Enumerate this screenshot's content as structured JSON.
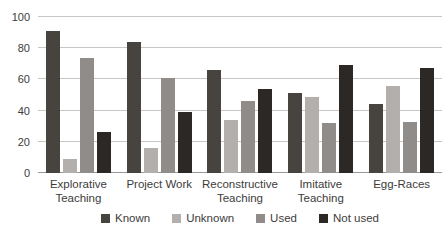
{
  "chart_data": {
    "type": "bar",
    "title": "",
    "xlabel": "",
    "ylabel": "",
    "categories": [
      "Explorative Teaching",
      "Project Work",
      "Reconstructive Teaching",
      "Imitative Teaching",
      "Egg-Races"
    ],
    "series": [
      {
        "name": "Known",
        "color": "#474440",
        "values": [
          91,
          84,
          66,
          51,
          44
        ]
      },
      {
        "name": "Unknown",
        "color": "#b2afac",
        "values": [
          9,
          16,
          34,
          49,
          56
        ]
      },
      {
        "name": "Used",
        "color": "#8f8c89",
        "values": [
          74,
          61,
          46,
          32,
          33
        ]
      },
      {
        "name": "Not used",
        "color": "#2b2826",
        "values": [
          26,
          39,
          54,
          69,
          67
        ]
      }
    ],
    "ylim": [
      0,
      100
    ],
    "yticks": [
      0,
      20,
      40,
      60,
      80,
      100
    ],
    "grid": true,
    "legend_position": "bottom",
    "style": {
      "gridline_color": "#c9c7c5",
      "axis_color": "#9a9795",
      "text_color": "#3d3c3b",
      "background": "#ffffff"
    }
  }
}
